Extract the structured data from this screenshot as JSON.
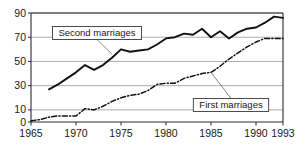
{
  "chart_data": {
    "type": "line",
    "title": "",
    "subtitle": "",
    "xlabel": "",
    "ylabel": "",
    "xlim": [
      1965,
      1993
    ],
    "ylim": [
      0,
      90
    ],
    "grid": true,
    "legend_position": "inline-callout-labels",
    "x_ticks": [
      1965,
      1970,
      1975,
      1980,
      1985,
      1990,
      1993
    ],
    "x_tick_labels": [
      "1965",
      "1970",
      "1975",
      "1980",
      "1985",
      "1990",
      "1993"
    ],
    "y_ticks": [
      0,
      10,
      30,
      50,
      70,
      90
    ],
    "y_tick_labels": [
      "0",
      "10",
      "30",
      "50",
      "70",
      "90"
    ],
    "series": [
      {
        "name": "Second marriages",
        "style": "solid",
        "x": [
          1967,
          1968,
          1969,
          1970,
          1971,
          1972,
          1973,
          1974,
          1975,
          1976,
          1977,
          1978,
          1979,
          1980,
          1981,
          1982,
          1983,
          1984,
          1985,
          1986,
          1987,
          1988,
          1989,
          1990,
          1991,
          1992,
          1993
        ],
        "values": [
          27,
          31,
          36,
          41,
          47,
          43,
          47,
          53,
          60,
          58,
          59,
          60,
          64,
          69,
          70,
          73,
          72,
          77,
          70,
          75,
          69,
          74,
          77,
          78,
          82,
          87,
          86
        ]
      },
      {
        "name": "First marriages",
        "style": "dash-dot",
        "x": [
          1965,
          1966,
          1967,
          1968,
          1969,
          1970,
          1971,
          1972,
          1973,
          1974,
          1975,
          1976,
          1977,
          1978,
          1979,
          1980,
          1981,
          1982,
          1983,
          1984,
          1985,
          1986,
          1987,
          1988,
          1989,
          1990,
          1991,
          1992,
          1993
        ],
        "values": [
          1,
          2,
          4,
          5,
          5,
          5,
          11,
          10,
          13,
          17,
          20,
          22,
          23,
          26,
          31,
          32,
          32,
          36,
          38,
          40,
          41,
          46,
          52,
          57,
          62,
          66,
          69,
          69,
          69
        ]
      }
    ],
    "annotations": [
      {
        "text": "Second marriages",
        "target_x": 1974,
        "target_y": 56
      },
      {
        "text": "First marriages",
        "target_x": 1985,
        "target_y": 41
      }
    ]
  },
  "callouts": {
    "second": "Second marriages",
    "first": "First marriages"
  },
  "axes": {
    "y_labels": [
      "90",
      "70",
      "50",
      "30",
      "10",
      "0"
    ],
    "x_labels": [
      "1965",
      "1970",
      "1975",
      "1980",
      "1985",
      "1990",
      "1993"
    ]
  }
}
